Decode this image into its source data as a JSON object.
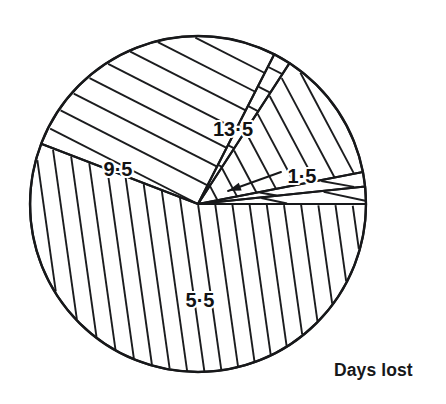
{
  "figure": {
    "caption": "Days lost",
    "caption_position": "bottom-right",
    "background_color": "#ffffff",
    "ink_color": "#17181a"
  },
  "chart_data": {
    "type": "pie",
    "title": "",
    "subtitle": "",
    "xlabel": "",
    "ylabel": "",
    "caption": "Days lost",
    "units": "days",
    "grid": false,
    "legend": "none",
    "labels_shown_on_slices": true,
    "decimal_separator": "middle-dot",
    "total": 36.0,
    "center": {
      "x": 198,
      "y": 204
    },
    "radius": 168,
    "categories": [
      "13·5",
      "1·5",
      "5·5",
      "9·5",
      "sliver-a",
      "sliver-b"
    ],
    "values": [
      13.5,
      1.5,
      5.5,
      9.5,
      0.6,
      0.7
    ],
    "slices": [
      {
        "name": "slice-5-5",
        "label": "5·5",
        "value": 5.5,
        "label_visible": true,
        "start_angle_deg": 0,
        "end_angle_deg": 201,
        "hatch_angle_deg": 82,
        "hatch_spacing": 17,
        "label_x": 200,
        "label_y": 302,
        "leader": false
      },
      {
        "name": "slice-9-5",
        "label": "9·5",
        "value": 9.5,
        "label_visible": true,
        "start_angle_deg": 201,
        "end_angle_deg": 297,
        "hatch_angle_deg": 27,
        "hatch_spacing": 21,
        "label_x": 118,
        "label_y": 171,
        "leader": false
      },
      {
        "name": "slice-sliver-a",
        "label": "",
        "value": 0.6,
        "label_visible": false,
        "start_angle_deg": 297,
        "end_angle_deg": 303,
        "hatch_angle_deg": 27,
        "hatch_spacing": 22,
        "label_x": 0,
        "label_y": 0,
        "leader": false
      },
      {
        "name": "slice-13-5",
        "label": "13·5",
        "value": 13.5,
        "label_visible": true,
        "start_angle_deg": 303,
        "end_angle_deg": 349,
        "hatch_angle_deg": 62,
        "hatch_spacing": 19,
        "label_x": 233,
        "label_y": 131,
        "leader": false
      },
      {
        "name": "slice-sliver-b",
        "label": "",
        "value": 0.7,
        "label_visible": false,
        "start_angle_deg": 349,
        "end_angle_deg": 354,
        "hatch_angle_deg": 10,
        "hatch_spacing": 22,
        "label_x": 0,
        "label_y": 0,
        "leader": false
      },
      {
        "name": "slice-1-5",
        "label": "1·5",
        "value": 1.5,
        "label_visible": true,
        "start_angle_deg": 354,
        "end_angle_deg": 360,
        "hatch_angle_deg": 12,
        "hatch_spacing": 19,
        "label_x": 302,
        "label_y": 178,
        "leader": true,
        "leader_from_x": 281,
        "leader_from_y": 172,
        "leader_to_x": 228,
        "leader_to_y": 191
      }
    ]
  }
}
